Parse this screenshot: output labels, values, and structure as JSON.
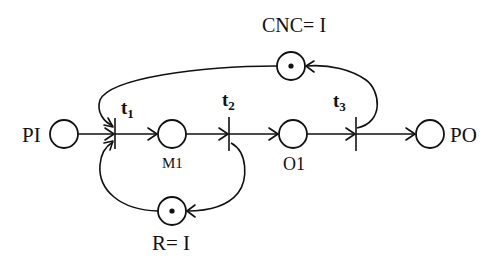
{
  "diagram": {
    "type": "petri-net",
    "places": [
      {
        "id": "PI",
        "label": "PI",
        "cx": 64,
        "cy": 134,
        "tokens": 0
      },
      {
        "id": "M1",
        "label": "M1",
        "cx": 172,
        "cy": 134,
        "tokens": 0
      },
      {
        "id": "O1",
        "label": "O1",
        "cx": 293,
        "cy": 134,
        "tokens": 0
      },
      {
        "id": "PO",
        "label": "PO",
        "cx": 430,
        "cy": 134,
        "tokens": 0
      },
      {
        "id": "CNC",
        "label": "CNC= I",
        "cx": 291,
        "cy": 66,
        "tokens": 1
      },
      {
        "id": "R",
        "label": "R= I",
        "cx": 172,
        "cy": 211,
        "tokens": 1
      }
    ],
    "transitions": [
      {
        "id": "t1",
        "label": "t",
        "sub": "1",
        "x": 115
      },
      {
        "id": "t2",
        "label": "t",
        "sub": "2",
        "x": 229
      },
      {
        "id": "t3",
        "label": "t",
        "sub": "3",
        "x": 356
      }
    ],
    "arcs": [
      {
        "from": "PI",
        "to": "t1"
      },
      {
        "from": "t1",
        "to": "M1"
      },
      {
        "from": "M1",
        "to": "t2"
      },
      {
        "from": "t2",
        "to": "O1"
      },
      {
        "from": "O1",
        "to": "t3"
      },
      {
        "from": "t3",
        "to": "PO"
      },
      {
        "from": "CNC",
        "to": "t1"
      },
      {
        "from": "t3",
        "to": "CNC"
      },
      {
        "from": "R",
        "to": "t1"
      },
      {
        "from": "t2",
        "to": "R"
      }
    ]
  }
}
